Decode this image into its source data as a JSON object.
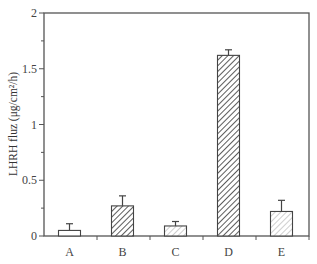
{
  "chart_data": {
    "type": "bar",
    "title": "",
    "xlabel": "",
    "ylabel": "LHRH fluz (μg/cm²/h)",
    "ylim": [
      0,
      2
    ],
    "yticks": [
      0,
      0.5,
      1,
      1.5,
      2
    ],
    "ytick_labels": [
      "0",
      "0.5",
      "1",
      "1.5",
      "2"
    ],
    "minor_yticks": [
      0.25,
      0.75,
      1.25,
      1.75
    ],
    "grid": false,
    "legend": null,
    "categories": [
      "A",
      "B",
      "C",
      "D",
      "E"
    ],
    "values": [
      0.05,
      0.27,
      0.09,
      1.62,
      0.22
    ],
    "error_upper": [
      0.11,
      0.36,
      0.13,
      1.67,
      0.32
    ],
    "errors": [
      0.06,
      0.09,
      0.04,
      0.05,
      0.1
    ],
    "fill_styles": [
      "empty",
      "dense-hatch",
      "light-hatch",
      "dense-hatch",
      "light-hatch"
    ]
  },
  "style": {
    "axis_color": "#555555",
    "bar_edge": "#444444",
    "dense_hatch": "#333333",
    "light_hatch": "#9a9a9a"
  }
}
